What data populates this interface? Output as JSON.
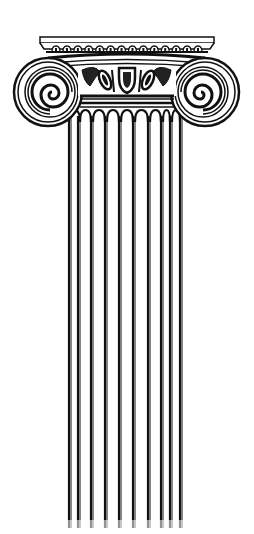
{
  "illustration": {
    "subject": "Ionic column",
    "background": "#ffffff",
    "ink": "#111111",
    "width": 254,
    "height": 534
  },
  "capital": {
    "abacus": {
      "x": 40,
      "y": 37,
      "width": 174,
      "height": 11
    },
    "dentil_count": 14,
    "volute_left": {
      "cx": 48,
      "cy": 92
    },
    "volute_right": {
      "cx": 205,
      "cy": 92
    },
    "echinus": {
      "x": 80,
      "y": 68,
      "width": 94,
      "height": 28
    },
    "astragal": {
      "x": 78,
      "y": 96,
      "width": 98,
      "height": 12
    }
  },
  "shaft": {
    "top": 108,
    "bottom": 528,
    "flute_lines_x": [
      69,
      71,
      78,
      80,
      91,
      93,
      105,
      107,
      119,
      121,
      133,
      135,
      148,
      150,
      161,
      163,
      170,
      172,
      180,
      182
    ]
  }
}
